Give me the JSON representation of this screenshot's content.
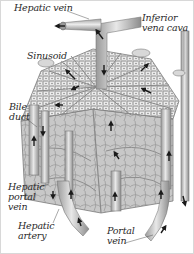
{
  "diagram": {
    "style": "grayscale anatomical illustration",
    "colors": {
      "background": "#ffffff",
      "border": "#d8d8d8",
      "tissue_light": "#e6e6e6",
      "tissue_mid": "#c4c4c4",
      "tissue_dark": "#8a8a8a",
      "arrow": "#1a1a1a",
      "label_text": "#2a2a2a"
    },
    "labels": [
      {
        "id": "hepatic-vein",
        "line1": "Hepatic vein",
        "line2": ""
      },
      {
        "id": "inferior-vena-cava",
        "line1": "Inferior",
        "line2": "vena cava"
      },
      {
        "id": "sinusoid",
        "line1": "Sinusoid",
        "line2": ""
      },
      {
        "id": "bile-duct",
        "line1": "Bile",
        "line2": "duct"
      },
      {
        "id": "hepatic-portal-vein",
        "line1": "Hepatic",
        "line2": "portal",
        "line3": "vein"
      },
      {
        "id": "hepatic-artery",
        "line1": "Hepatic",
        "line2": "artery"
      },
      {
        "id": "portal-vein",
        "line1": "Portal",
        "line2": "vein"
      }
    ]
  }
}
